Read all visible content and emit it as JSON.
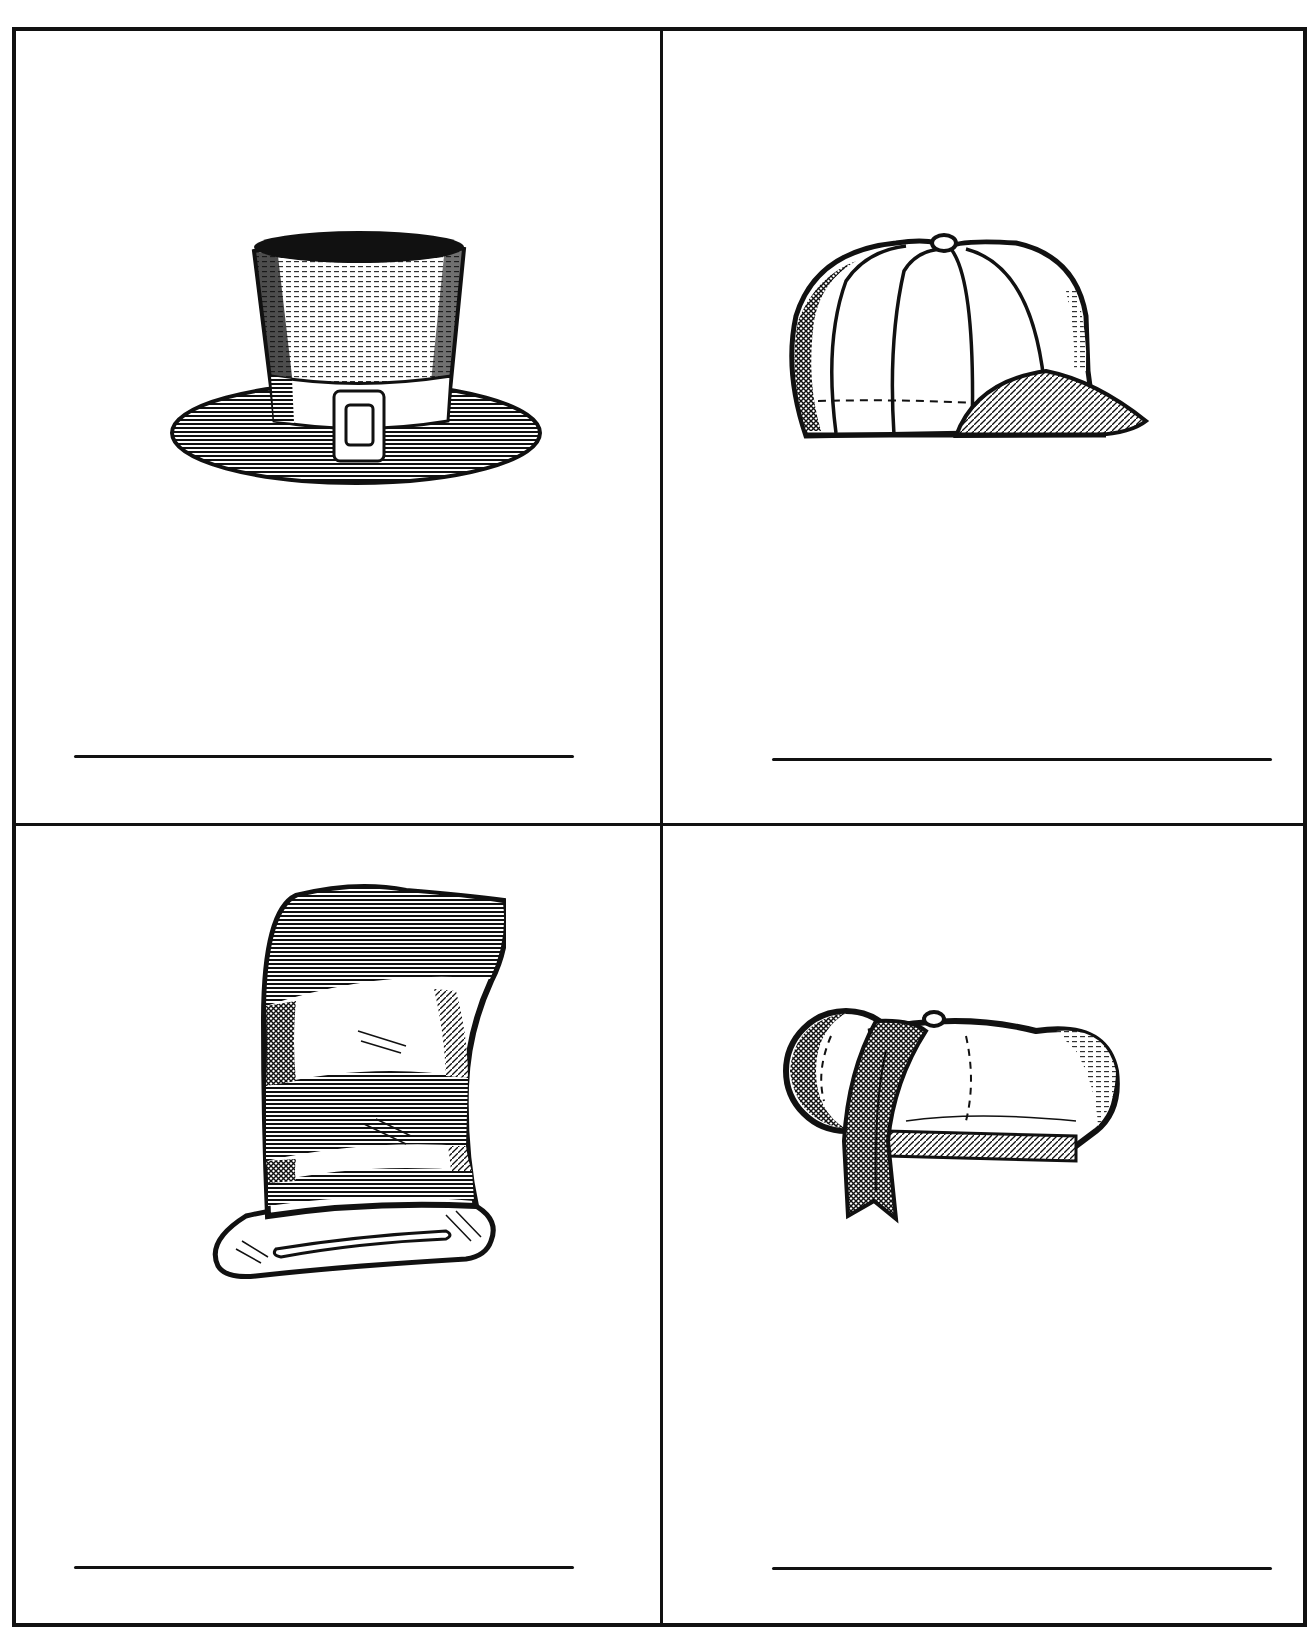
{
  "worksheet": {
    "cells": [
      {
        "id": "top-left",
        "picture": "top-hat-with-buckle",
        "answer_text": "",
        "answer_placeholder": "write the word"
      },
      {
        "id": "top-right",
        "picture": "baseball-cap",
        "answer_text": "",
        "answer_placeholder": "write the word"
      },
      {
        "id": "bottom-left",
        "picture": "striped-cat-in-the-hat",
        "answer_text": "",
        "answer_placeholder": "write the word"
      },
      {
        "id": "bottom-right",
        "picture": "bonnet-with-ribbon",
        "answer_text": "",
        "answer_placeholder": "write the word"
      }
    ]
  },
  "colors": {
    "ink": "#111111",
    "paper": "#ffffff"
  }
}
